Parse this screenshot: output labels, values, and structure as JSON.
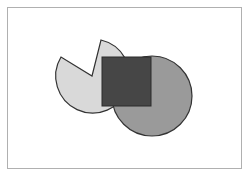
{
  "canvas": {
    "width": 248,
    "height": 175,
    "background": "#ffffff"
  },
  "frame": {
    "x": 7,
    "y": 7,
    "width": 234,
    "height": 161,
    "stroke": "#b0b0b0"
  },
  "shapes": {
    "pie": {
      "type": "pie-sector",
      "cx": 93,
      "cy": 77,
      "r": 37,
      "fill": "#d9d9d9",
      "stroke": "#333333",
      "notch_start": [
        101,
        40
      ],
      "notch_apex": [
        92,
        76
      ],
      "notch_end": [
        61,
        57
      ]
    },
    "circle": {
      "type": "circle",
      "cx": 152,
      "cy": 96,
      "r": 40,
      "fill": "#9a9a9a",
      "stroke": "#333333"
    },
    "square": {
      "type": "rect",
      "x": 102,
      "y": 57,
      "width": 49,
      "height": 49,
      "fill": "#464646",
      "stroke": "#2a2a2a"
    }
  }
}
